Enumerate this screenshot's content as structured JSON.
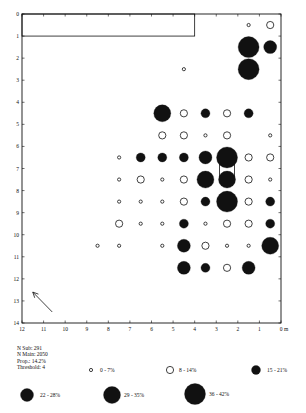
{
  "chart_data": {
    "type": "scatter",
    "subtype": "proportional-symbol grid map",
    "title": "",
    "xlabel": "m",
    "ylabel": "",
    "xlim": [
      12,
      0
    ],
    "ylim": [
      14,
      0
    ],
    "x_ticks": [
      "12",
      "11",
      "10",
      "9",
      "8",
      "7",
      "6",
      "5",
      "4",
      "3",
      "2",
      "1",
      "0 m"
    ],
    "y_ticks": [
      "0",
      "1",
      "2",
      "3",
      "4",
      "5",
      "6",
      "7",
      "8",
      "9",
      "10",
      "11",
      "12",
      "13",
      "14"
    ],
    "grid": false,
    "classes": [
      {
        "id": 0,
        "label": "0 - 7%",
        "style": "open",
        "diameter": 4
      },
      {
        "id": 1,
        "label": "8 - 14%",
        "style": "open",
        "diameter": 8
      },
      {
        "id": 2,
        "label": "15 - 21%",
        "style": "filled",
        "diameter": 9
      },
      {
        "id": 3,
        "label": "22 - 28%",
        "style": "filled",
        "diameter": 13
      },
      {
        "id": 4,
        "label": "29 - 35%",
        "style": "filled",
        "diameter": 17
      },
      {
        "id": 5,
        "label": "36 - 42%",
        "style": "filled",
        "diameter": 21
      }
    ],
    "points": [
      {
        "x": 1.5,
        "y": 0.5,
        "class": 0
      },
      {
        "x": 0.5,
        "y": 0.5,
        "class": 1
      },
      {
        "x": 1.5,
        "y": 1.5,
        "class": 5
      },
      {
        "x": 0.5,
        "y": 1.5,
        "class": 3
      },
      {
        "x": 1.5,
        "y": 2.5,
        "class": 5
      },
      {
        "x": 4.5,
        "y": 2.5,
        "class": 0
      },
      {
        "x": 5.5,
        "y": 4.5,
        "class": 4
      },
      {
        "x": 4.5,
        "y": 4.5,
        "class": 1
      },
      {
        "x": 3.5,
        "y": 4.5,
        "class": 2
      },
      {
        "x": 2.5,
        "y": 4.5,
        "class": 1
      },
      {
        "x": 1.5,
        "y": 4.5,
        "class": 2
      },
      {
        "x": 5.5,
        "y": 5.5,
        "class": 1
      },
      {
        "x": 4.5,
        "y": 5.5,
        "class": 1
      },
      {
        "x": 3.5,
        "y": 5.5,
        "class": 0
      },
      {
        "x": 2.5,
        "y": 5.5,
        "class": 1
      },
      {
        "x": 0.5,
        "y": 5.5,
        "class": 0
      },
      {
        "x": 7.5,
        "y": 6.5,
        "class": 0
      },
      {
        "x": 6.5,
        "y": 6.5,
        "class": 2
      },
      {
        "x": 5.5,
        "y": 6.5,
        "class": 2
      },
      {
        "x": 4.5,
        "y": 6.5,
        "class": 2
      },
      {
        "x": 3.5,
        "y": 6.5,
        "class": 3
      },
      {
        "x": 2.5,
        "y": 6.5,
        "class": 5
      },
      {
        "x": 1.5,
        "y": 6.5,
        "class": 1
      },
      {
        "x": 0.5,
        "y": 6.5,
        "class": 1
      },
      {
        "x": 7.5,
        "y": 7.5,
        "class": 0
      },
      {
        "x": 6.5,
        "y": 7.5,
        "class": 1
      },
      {
        "x": 5.5,
        "y": 7.5,
        "class": 0
      },
      {
        "x": 4.5,
        "y": 7.5,
        "class": 1
      },
      {
        "x": 3.5,
        "y": 7.5,
        "class": 4
      },
      {
        "x": 2.5,
        "y": 7.5,
        "class": 4
      },
      {
        "x": 1.5,
        "y": 7.5,
        "class": 1
      },
      {
        "x": 0.5,
        "y": 7.5,
        "class": 0
      },
      {
        "x": 7.5,
        "y": 8.5,
        "class": 0
      },
      {
        "x": 6.5,
        "y": 8.5,
        "class": 0
      },
      {
        "x": 5.5,
        "y": 8.5,
        "class": 0
      },
      {
        "x": 4.5,
        "y": 8.5,
        "class": 1
      },
      {
        "x": 3.5,
        "y": 8.5,
        "class": 2
      },
      {
        "x": 2.5,
        "y": 8.5,
        "class": 5
      },
      {
        "x": 1.5,
        "y": 8.5,
        "class": 1
      },
      {
        "x": 0.5,
        "y": 8.5,
        "class": 2
      },
      {
        "x": 7.5,
        "y": 9.5,
        "class": 1
      },
      {
        "x": 6.5,
        "y": 9.5,
        "class": 0
      },
      {
        "x": 5.5,
        "y": 9.5,
        "class": 0
      },
      {
        "x": 4.5,
        "y": 9.5,
        "class": 2
      },
      {
        "x": 3.5,
        "y": 9.5,
        "class": 0
      },
      {
        "x": 2.5,
        "y": 9.5,
        "class": 1
      },
      {
        "x": 1.5,
        "y": 9.5,
        "class": 1
      },
      {
        "x": 0.5,
        "y": 9.5,
        "class": 2
      },
      {
        "x": 8.5,
        "y": 10.5,
        "class": 0
      },
      {
        "x": 7.5,
        "y": 10.5,
        "class": 0
      },
      {
        "x": 5.5,
        "y": 10.5,
        "class": 0
      },
      {
        "x": 4.5,
        "y": 10.5,
        "class": 3
      },
      {
        "x": 3.5,
        "y": 10.5,
        "class": 1
      },
      {
        "x": 2.5,
        "y": 10.5,
        "class": 0
      },
      {
        "x": 1.5,
        "y": 10.5,
        "class": 0
      },
      {
        "x": 0.5,
        "y": 10.5,
        "class": 4
      },
      {
        "x": 4.5,
        "y": 11.5,
        "class": 3
      },
      {
        "x": 3.5,
        "y": 11.5,
        "class": 2
      },
      {
        "x": 2.5,
        "y": 11.5,
        "class": 1
      },
      {
        "x": 1.5,
        "y": 11.5,
        "class": 3
      }
    ],
    "annotations": [
      {
        "type": "rectangle",
        "x0": 12,
        "x1": 4,
        "y0": 0,
        "y1": 1
      },
      {
        "type": "rectangle",
        "x0": 2.85,
        "x1": 2.15,
        "y0": 6.5,
        "y1": 7.5
      },
      {
        "type": "north-arrow",
        "from": [
          10.6,
          13.5
        ],
        "to": [
          11.5,
          12.6
        ]
      }
    ],
    "legend_position": "bottom"
  },
  "stats": {
    "n_sub": "N Sub: 291",
    "n_main": "N Main: 2050",
    "prop": "Prop.: 14.2%",
    "threshold": "Threshold: 4"
  },
  "legend": {
    "items": [
      {
        "label": "0 - 7%",
        "cx": 91,
        "cy": 370,
        "textX": 100
      },
      {
        "label": "8 - 14%",
        "cx": 170,
        "cy": 370,
        "textX": 179
      },
      {
        "label": "15 - 21%",
        "cx": 256,
        "cy": 370,
        "textX": 267
      },
      {
        "label": "22 - 28%",
        "cx": 27,
        "cy": 395,
        "textX": 40
      },
      {
        "label": "29 - 35%",
        "cx": 112,
        "cy": 395,
        "textX": 124
      },
      {
        "label": "36 - 42%",
        "cx": 195,
        "cy": 394,
        "textX": 209
      }
    ]
  },
  "colors": {
    "ink": "#111111",
    "background": "#ffffff"
  }
}
